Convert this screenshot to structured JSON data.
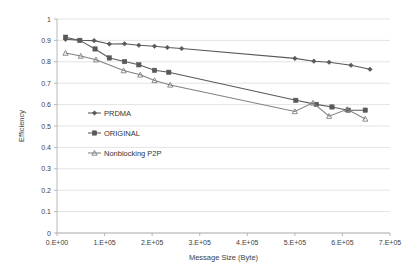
{
  "chart_data": {
    "type": "line",
    "title": "",
    "xlabel": "Message Size (Byte)",
    "ylabel": "Efficiency",
    "xlim": [
      0,
      700000
    ],
    "ylim": [
      0,
      1
    ],
    "xticks": [
      0,
      100000,
      200000,
      300000,
      400000,
      500000,
      600000,
      700000
    ],
    "xtick_labels": [
      "0.E+00",
      "1.E+05",
      "2.E+05",
      "3.E+05",
      "4.E+05",
      "5.E+05",
      "6.E+05",
      "7.E+05"
    ],
    "yticks": [
      0,
      0.1,
      0.2,
      0.3,
      0.4,
      0.5,
      0.6,
      0.7,
      0.8,
      0.9,
      1
    ],
    "ytick_labels": [
      "0",
      "0.1",
      "0.2",
      "0.3",
      "0.4",
      "0.5",
      "0.6",
      "0.7",
      "0.8",
      "0.9",
      "1"
    ],
    "grid": "horizontal",
    "legend_position": "inside-left",
    "series": [
      {
        "name": "PRDMA",
        "color": "#595959",
        "marker": "diamond",
        "points": [
          [
            18000,
            0.905
          ],
          [
            48000,
            0.901
          ],
          [
            78000,
            0.899
          ],
          [
            110000,
            0.883
          ],
          [
            142000,
            0.884
          ],
          [
            172000,
            0.877
          ],
          [
            205000,
            0.873
          ],
          [
            232000,
            0.867
          ],
          [
            262000,
            0.862
          ],
          [
            500000,
            0.816
          ],
          [
            540000,
            0.803
          ],
          [
            572000,
            0.798
          ],
          [
            618000,
            0.784
          ],
          [
            658000,
            0.765
          ]
        ]
      },
      {
        "name": "ORIGINAL",
        "color": "#595959",
        "marker": "square",
        "points": [
          [
            18000,
            0.915
          ],
          [
            48000,
            0.9
          ],
          [
            80000,
            0.86
          ],
          [
            110000,
            0.818
          ],
          [
            142000,
            0.801
          ],
          [
            172000,
            0.786
          ],
          [
            205000,
            0.76
          ],
          [
            235000,
            0.751
          ],
          [
            502000,
            0.62
          ],
          [
            545000,
            0.601
          ],
          [
            578000,
            0.589
          ],
          [
            612000,
            0.574
          ],
          [
            648000,
            0.574
          ]
        ]
      },
      {
        "name": "Nonblocking P2P",
        "color": "#808080",
        "marker": "triangle",
        "points": [
          [
            18000,
            0.841
          ],
          [
            50000,
            0.827
          ],
          [
            82000,
            0.81
          ],
          [
            140000,
            0.759
          ],
          [
            175000,
            0.739
          ],
          [
            205000,
            0.713
          ],
          [
            238000,
            0.692
          ],
          [
            500000,
            0.568
          ],
          [
            538000,
            0.608
          ],
          [
            572000,
            0.546
          ],
          [
            610000,
            0.578
          ],
          [
            648000,
            0.533
          ]
        ]
      }
    ]
  },
  "legend": {
    "items": [
      {
        "label": "PRDMA"
      },
      {
        "label": "ORIGINAL"
      },
      {
        "label": "Nonblocking P2P"
      }
    ]
  }
}
